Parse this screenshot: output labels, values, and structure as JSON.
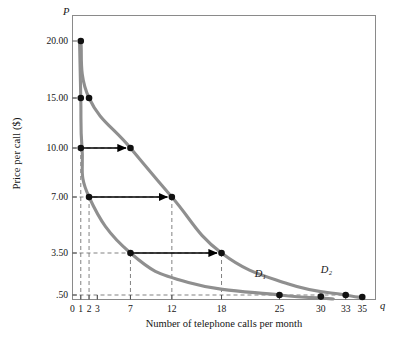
{
  "figure": {
    "p_axis_symbol": "P",
    "q_axis_symbol": "q",
    "ylabel": "Price per call ($)",
    "xlabel": "Number of telephone calls per month"
  },
  "chart_data": {
    "type": "line",
    "title": "",
    "xlabel": "Number of telephone calls per month",
    "ylabel": "Price per call ($)",
    "x_axis_symbol": "q",
    "y_axis_symbol": "P",
    "xlim": [
      0,
      36.6
    ],
    "ylim": [
      0,
      21.6
    ],
    "grid": false,
    "gridlines": "dashed guide lines from marked points to both axes",
    "legend": "inline curve labels",
    "xticks": [
      0,
      1,
      2,
      3,
      7,
      12,
      18,
      25,
      30,
      33,
      35
    ],
    "xticklabels": [
      "0",
      "1",
      "2",
      "3",
      "7",
      "12",
      "18",
      "25",
      "30",
      "33",
      "35"
    ],
    "yticks": [
      20.0,
      15.0,
      10.0,
      7.0,
      3.5,
      0.5
    ],
    "yticklabels": [
      "20.00",
      "15.00",
      "10.00",
      "7.00",
      "3.50",
      ".50"
    ],
    "series": [
      {
        "name": "D1",
        "label": "D₁",
        "color": "#8f8f8f",
        "points": [
          {
            "q": 1,
            "p": 20.0,
            "marker": true
          },
          {
            "q": 1,
            "p": 15.0,
            "marker": true
          },
          {
            "q": 1,
            "p": 10.0,
            "marker": true
          },
          {
            "q": 2,
            "p": 7.0,
            "marker": true
          },
          {
            "q": 7,
            "p": 3.5,
            "marker": true
          },
          {
            "q": 25,
            "p": 0.5,
            "marker": true
          },
          {
            "q": 30,
            "p": 0.3,
            "marker": true
          }
        ]
      },
      {
        "name": "D2",
        "label": "D₂",
        "color": "#8f8f8f",
        "points": [
          {
            "q": 2,
            "p": 15.0,
            "marker": true
          },
          {
            "q": 7,
            "p": 10.0,
            "marker": true
          },
          {
            "q": 12,
            "p": 7.0,
            "marker": true
          },
          {
            "q": 18,
            "p": 3.5,
            "marker": true
          },
          {
            "q": 33,
            "p": 0.5,
            "marker": true
          },
          {
            "q": 35,
            "p": 0.25,
            "marker": true
          }
        ]
      }
    ],
    "shift_arrows": [
      {
        "p": 10.0,
        "from_q": 1,
        "to_q": 7
      },
      {
        "p": 7.0,
        "from_q": 2,
        "to_q": 12
      },
      {
        "p": 3.5,
        "from_q": 7,
        "to_q": 18
      }
    ],
    "annotations": [
      {
        "text": "D₁",
        "q": 22.0,
        "p": 1.9
      },
      {
        "text": "D₂",
        "q": 30.0,
        "p": 2.2
      }
    ]
  }
}
